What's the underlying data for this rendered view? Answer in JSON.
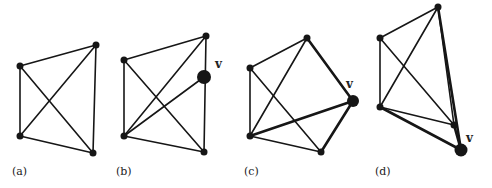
{
  "figure": {
    "panels": [
      {
        "label": "(a)",
        "label_pos": [
          12,
          175
        ],
        "vertices": [
          {
            "id": "p1",
            "x": 20,
            "y": 66,
            "r": 3.5
          },
          {
            "id": "p2",
            "x": 96,
            "y": 45,
            "r": 3.5
          },
          {
            "id": "p3",
            "x": 20,
            "y": 136,
            "r": 3.5
          },
          {
            "id": "p4",
            "x": 93,
            "y": 153,
            "r": 3.5
          }
        ],
        "edges": [
          [
            "p1",
            "p2",
            0
          ],
          [
            "p1",
            "p3",
            0
          ],
          [
            "p1",
            "p4",
            0
          ],
          [
            "p2",
            "p3",
            0
          ],
          [
            "p2",
            "p4",
            0
          ],
          [
            "p3",
            "p4",
            0
          ]
        ]
      },
      {
        "label": "(b)",
        "label_pos": [
          116,
          175
        ],
        "vertex_label": "v",
        "vertex_label_pos": [
          215,
          68
        ],
        "vertices": [
          {
            "id": "p1",
            "x": 124,
            "y": 60,
            "r": 3.5
          },
          {
            "id": "p2",
            "x": 206,
            "y": 36,
            "r": 3.5
          },
          {
            "id": "p3",
            "x": 124,
            "y": 136,
            "r": 3.5
          },
          {
            "id": "p4",
            "x": 204,
            "y": 152,
            "r": 3.5
          },
          {
            "id": "v",
            "x": 204,
            "y": 77,
            "r": 7
          }
        ],
        "edges": [
          [
            "p1",
            "p2",
            0
          ],
          [
            "p1",
            "p3",
            0
          ],
          [
            "p1",
            "p4",
            0
          ],
          [
            "p2",
            "p3",
            0
          ],
          [
            "p2",
            "p4",
            0
          ],
          [
            "p3",
            "p4",
            0
          ],
          [
            "v",
            "p3",
            0
          ]
        ]
      },
      {
        "label": "(c)",
        "label_pos": [
          244,
          175
        ],
        "vertex_label": "v",
        "vertex_label_pos": [
          346,
          88
        ],
        "vertices": [
          {
            "id": "p1",
            "x": 250,
            "y": 68,
            "r": 3.5
          },
          {
            "id": "p2",
            "x": 307,
            "y": 38,
            "r": 3.5
          },
          {
            "id": "p3",
            "x": 250,
            "y": 136,
            "r": 3.5
          },
          {
            "id": "p4",
            "x": 321,
            "y": 152,
            "r": 3.5
          },
          {
            "id": "v",
            "x": 353,
            "y": 101,
            "r": 6
          }
        ],
        "edges": [
          [
            "p1",
            "p2",
            0
          ],
          [
            "p1",
            "p3",
            0
          ],
          [
            "p1",
            "p4",
            0
          ],
          [
            "p2",
            "p3",
            0
          ],
          [
            "p3",
            "p4",
            0
          ],
          [
            "v",
            "p2",
            1
          ],
          [
            "v",
            "p3",
            1
          ],
          [
            "v",
            "p4",
            1
          ]
        ]
      },
      {
        "label": "(d)",
        "label_pos": [
          375,
          175
        ],
        "vertex_label": "v",
        "vertex_label_pos": [
          466,
          142
        ],
        "vertices": [
          {
            "id": "p1",
            "x": 380,
            "y": 38,
            "r": 3.5
          },
          {
            "id": "p2",
            "x": 438,
            "y": 7,
            "r": 3.5
          },
          {
            "id": "p3",
            "x": 380,
            "y": 107,
            "r": 3.5
          },
          {
            "id": "p4",
            "x": 454,
            "y": 125,
            "r": 3.5
          },
          {
            "id": "v",
            "x": 461,
            "y": 150,
            "r": 6.5
          }
        ],
        "edges": [
          [
            "p1",
            "p2",
            0
          ],
          [
            "p1",
            "p3",
            0
          ],
          [
            "p1",
            "p4",
            0
          ],
          [
            "p2",
            "p3",
            0
          ],
          [
            "p3",
            "p4",
            0
          ],
          [
            "p2",
            "p4",
            0
          ],
          [
            "v",
            "p2",
            1
          ],
          [
            "v",
            "p3",
            1
          ],
          [
            "v",
            "p4",
            1
          ]
        ]
      }
    ]
  }
}
